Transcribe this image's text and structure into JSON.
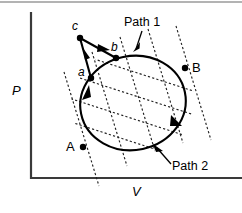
{
  "figure": {
    "title_visible": false,
    "background": "#ffffff",
    "ink_color": "#000000",
    "axis_color": "#3a3a3a"
  },
  "axes": {
    "y_label": "P",
    "x_label": "V",
    "y_axis_name": "pressure-axis",
    "x_axis_name": "volume-axis"
  },
  "points": [
    {
      "id": "c",
      "label": "c",
      "style": "italic-lower",
      "x": 80,
      "y": 38,
      "label_x": 74,
      "label_y": 29
    },
    {
      "id": "b",
      "label": "b",
      "style": "italic-lower",
      "x": 116,
      "y": 58,
      "label_x": 113,
      "label_y": 50
    },
    {
      "id": "a",
      "label": "a",
      "style": "italic-lower",
      "x": 91,
      "y": 78,
      "label_x": 80,
      "label_y": 76
    },
    {
      "id": "B",
      "label": "B",
      "style": "upright-upper",
      "x": 185,
      "y": 68,
      "label_x": 192,
      "label_y": 70
    },
    {
      "id": "A",
      "label": "A",
      "style": "upright-upper",
      "x": 83,
      "y": 147,
      "label_x": 70,
      "label_y": 150
    }
  ],
  "annotations": [
    {
      "id": "path1",
      "text": "Path 1",
      "text_x": 126,
      "text_y": 26,
      "pointer_from_x": 142,
      "pointer_from_y": 30,
      "pointer_to_x": 136,
      "pointer_to_y": 50
    },
    {
      "id": "path2",
      "text": "Path 2",
      "text_x": 172,
      "text_y": 166,
      "pointer_from_x": 171,
      "pointer_from_y": 161,
      "pointer_to_x": 155,
      "pointer_to_y": 146
    }
  ],
  "cycle": {
    "name": "closed-cycle-ellipse",
    "center_x": 133,
    "center_y": 103,
    "radius_x": 53,
    "radius_y": 47,
    "rotation_deg": -12,
    "direction": "counterclockwise-left-side-up",
    "arrow_positions": [
      "left-ascending",
      "lower-right-descending"
    ]
  },
  "detour": {
    "name": "path-a-c-b",
    "segments": [
      {
        "from": "a",
        "to": "c",
        "arrow": true
      },
      {
        "from": "c",
        "to": "b",
        "arrow": true
      }
    ]
  },
  "grid_families": [
    {
      "name": "isotherm-family",
      "count": 5,
      "style": "dashed",
      "slope": "shallow-down-right"
    },
    {
      "name": "adiabat-family",
      "count": 5,
      "style": "dashed",
      "slope": "steep-down-right"
    }
  ],
  "frame": {
    "top_rule_visible": true,
    "top_rule_y": 2
  }
}
